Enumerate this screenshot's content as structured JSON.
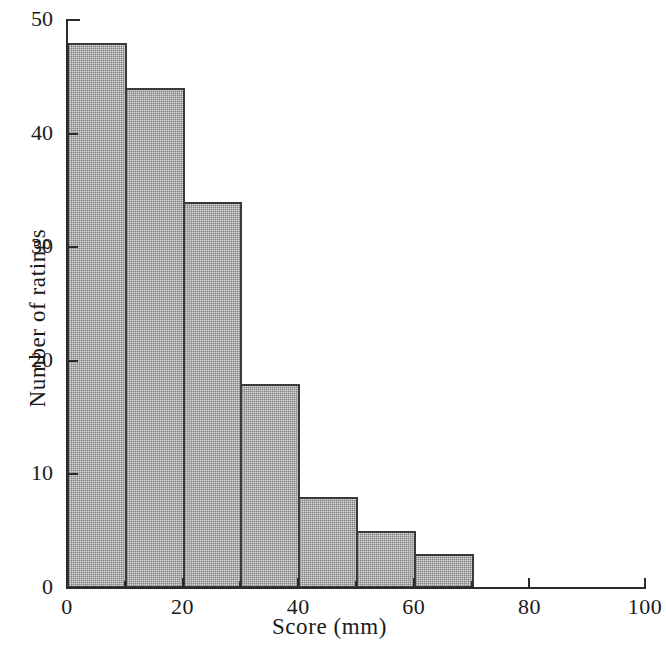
{
  "chart_data": {
    "type": "bar",
    "subtype": "histogram",
    "title": "",
    "xlabel": "Score (mm)",
    "ylabel": "Number of ratings",
    "xlim": [
      0,
      100
    ],
    "ylim": [
      0,
      50
    ],
    "bin_width": 10,
    "grid": false,
    "legend": null,
    "bar_fill_color": "#dcdcdc",
    "bar_edge_color": "#3a3a3a",
    "axis_color": "#2b2b2b",
    "categories": [
      "0-10",
      "10-20",
      "20-30",
      "30-40",
      "40-50",
      "50-60",
      "60-70"
    ],
    "bin_edges": [
      0,
      10,
      20,
      30,
      40,
      50,
      60,
      70
    ],
    "values": [
      48,
      44,
      34,
      18,
      8,
      5,
      3
    ],
    "x_ticks_major": [
      0,
      20,
      40,
      60,
      80,
      100
    ],
    "x_ticks_minor": [
      10,
      30,
      50,
      70,
      90
    ],
    "x_tick_labels": [
      "0",
      "20",
      "40",
      "60",
      "80",
      "100"
    ],
    "y_ticks_major": [
      0,
      10,
      20,
      30,
      40,
      50
    ],
    "y_tick_labels": [
      "0",
      "10",
      "20",
      "30",
      "40",
      "50"
    ]
  },
  "axes": {
    "x_title": "Score (mm)",
    "y_title": "Number of ratings"
  }
}
